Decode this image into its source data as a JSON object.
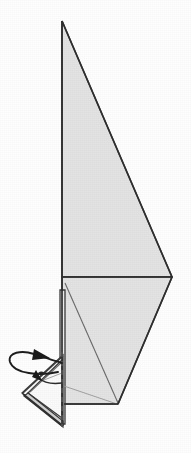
{
  "figure": {
    "kind": "origami-step-diagram",
    "title": "",
    "caption": "",
    "step_number": "",
    "background_color": "#ffffff",
    "paper_front_color": "#e4e4e4",
    "paper_light_color": "#ededed",
    "paper_white_color": "#fbfbfb",
    "edge_color": "#2f2f2f",
    "crease_color": "#6a6a6a",
    "arrow_color": "#1a1a1a",
    "canvas": {
      "width": 191,
      "height": 453
    }
  },
  "shapes": {
    "upper_triangle": {
      "name": "upper-sail-triangle",
      "points": "62,21 172,277 62,277",
      "fill": "#e4e4e4"
    },
    "lower_body": {
      "name": "lower-body-panel",
      "points": "62,277 172,277 118,404 63,404 62,283",
      "fill": "#e4e4e4"
    },
    "lower_left_sliver": {
      "name": "lower-left-edge-sliver",
      "points": "60,290 65,290 65,424 60,424",
      "fill": "#ededed"
    },
    "flap_outer": {
      "name": "bottom-left-flap-outer",
      "points": "63,355 22,393 63,425",
      "fill": "#fbfbfb"
    },
    "flap_inner": {
      "name": "bottom-left-flap-inner",
      "points": "62,360 28,393 62,418",
      "fill": "#ffffff"
    },
    "flap_shadow": {
      "name": "bottom-left-flap-shadow-edge",
      "points": "24,396 63,427 63,421 28,393",
      "fill": "#d9d9d9"
    }
  },
  "creases": {
    "diagonal_main": {
      "name": "diagonal-crease-main",
      "d": "M 65,283 L 118,403"
    },
    "diagonal_faint_lower": {
      "name": "diagonal-crease-faint-lower",
      "d": "M 64,386 L 117,404"
    },
    "horizontal_mid": {
      "name": "horizontal-fold-mid",
      "d": "M 62,277 L 172,277"
    },
    "left_vertical_upper": {
      "name": "left-edge-vertical-upper",
      "d": "M 62,21 L 62,277"
    },
    "left_vertical_lower": {
      "name": "left-edge-vertical-lower",
      "d": "M 62,277 L 62,426"
    },
    "right_upper_diagonal": {
      "name": "right-edge-upper-diagonal",
      "d": "M 62,21 L 172,277"
    },
    "right_lower_diagonal": {
      "name": "right-edge-lower-diagonal",
      "d": "M 172,277 L 118,404"
    },
    "bottom_edge": {
      "name": "bottom-edge",
      "d": "M 118,404 L 64,404"
    },
    "dashed_fold": {
      "name": "valley-fold-dashed-line",
      "d": "M 62,352 L 62,427"
    },
    "flap_crease_a": {
      "name": "flap-crease-upper",
      "d": "M 63,356 L 23,393"
    },
    "flap_crease_b": {
      "name": "flap-crease-lower",
      "d": "M 23,394 L 63,426"
    },
    "flap_crease_inner_diag": {
      "name": "flap-inner-diagonal-crease",
      "d": "M 30,392 L 62,362"
    },
    "flap_small_line": {
      "name": "flap-small-detail-line",
      "d": "M 44,380 L 62,373"
    }
  },
  "arrows": {
    "big_unfold": {
      "name": "unfold-rotate-arrow",
      "path": "M 58,372 C 40,376 14,374 10,362 C 7,352 22,350 34,354 C 44,357 54,361 62,363",
      "head_points": "34,349 50,358 32,360",
      "label": ""
    },
    "small_inner": {
      "name": "inner-fold-arrow",
      "path": "M 62,383 C 54,384 44,383 39,378 C 36,374 40,371 44,373",
      "head_points": "36,370 42,381 32,377",
      "label": ""
    }
  },
  "labels": {
    "items": []
  }
}
